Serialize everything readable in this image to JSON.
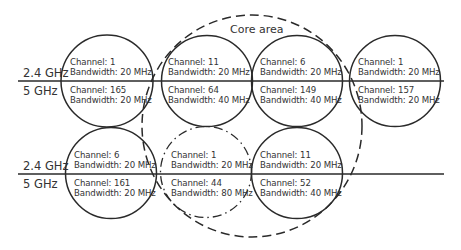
{
  "core_area": {
    "label": "Core area",
    "style": "dashed",
    "cx": 252,
    "cy": 126,
    "rx": 110,
    "ry": 111
  },
  "rows": [
    {
      "band_upper": "2.4 GHz",
      "band_lower": "5 GHz",
      "divider_y": 81,
      "aps": [
        {
          "cx": 107,
          "cy": 81,
          "style": "solid",
          "upper": {
            "channel": "Channel: 1",
            "bandwidth": "Bandwidth: 20 MHz"
          },
          "lower": {
            "channel": "Channel: 165",
            "bandwidth": "Bandwidth: 20 MHz"
          }
        },
        {
          "cx": 207,
          "cy": 81,
          "style": "solid",
          "upper": {
            "channel": "Channel: 11",
            "bandwidth": "Bandwidth: 20 MHz"
          },
          "lower": {
            "channel": "Channel: 64",
            "bandwidth": "Bandwidth: 40 MHz"
          }
        },
        {
          "cx": 297,
          "cy": 81,
          "style": "solid",
          "upper": {
            "channel": "Channel: 6",
            "bandwidth": "Bandwidth: 20 MHz"
          },
          "lower": {
            "channel": "Channel: 149",
            "bandwidth": "Bandwidth: 40 MHz"
          }
        },
        {
          "cx": 395,
          "cy": 81,
          "style": "solid",
          "upper": {
            "channel": "Channel: 1",
            "bandwidth": "Bandwidth: 20 MHz"
          },
          "lower": {
            "channel": "Channel: 157",
            "bandwidth": "Bandwidth: 20 MHz"
          }
        }
      ]
    },
    {
      "band_upper": "2.4 GHz",
      "band_lower": "5 GHz",
      "divider_y": 174,
      "aps": [
        {
          "cx": 111,
          "cy": 173,
          "style": "solid",
          "upper": {
            "channel": "Channel: 6",
            "bandwidth": "Bandwidth: 20 MHz"
          },
          "lower": {
            "channel": "Channel: 161",
            "bandwidth": "Bandwidth: 20 MHz"
          }
        },
        {
          "cx": 206,
          "cy": 173,
          "style": "dash-dot",
          "upper": {
            "channel": "Channel: 1",
            "bandwidth": "Bandwidth: 20 MHz"
          },
          "lower": {
            "channel": "Channel: 44",
            "bandwidth": "Bandwidth: 80 MHz"
          }
        },
        {
          "cx": 297,
          "cy": 173,
          "style": "solid",
          "upper": {
            "channel": "Channel: 11",
            "bandwidth": "Bandwidth: 20 MHz"
          },
          "lower": {
            "channel": "Channel: 52",
            "bandwidth": "Bandwidth: 40 MHz"
          }
        }
      ]
    }
  ],
  "colors": {
    "stroke": "#2a2a2a",
    "text": "#333333",
    "background": "#ffffff"
  }
}
